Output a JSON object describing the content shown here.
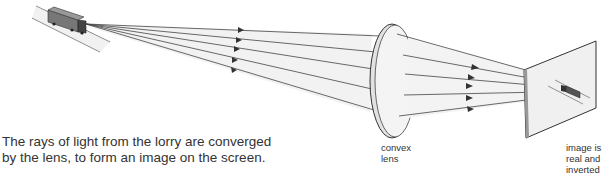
{
  "caption": {
    "line1": "The rays of light from the lorry are converged",
    "line2": "by the lens, to form an image on the screen."
  },
  "labels": {
    "lens_line1": "convex",
    "lens_line2": "lens",
    "screen_line1": "image is",
    "screen_line2": "real and",
    "screen_line3": "inverted"
  },
  "colors": {
    "ray": "#444444",
    "lens_fill": "#eeeeee",
    "screen_fill": "#f0f0f0",
    "text": "#333333"
  }
}
